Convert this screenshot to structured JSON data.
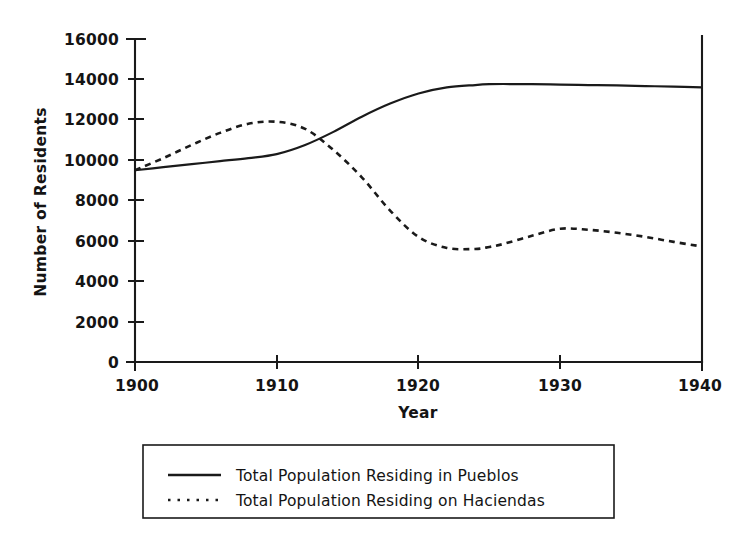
{
  "chart_data": {
    "type": "line",
    "title": "",
    "xlabel": "Year",
    "ylabel": "Number of Residents",
    "xlim": [
      1900,
      1940
    ],
    "ylim": [
      0,
      16000
    ],
    "grid": false,
    "legend_position": "bottom",
    "xticks": [
      1900,
      1910,
      1920,
      1930,
      1940
    ],
    "xtick_labels": [
      "1900",
      "1910",
      "1920",
      "1930",
      "1940"
    ],
    "yticks": [
      0,
      2000,
      4000,
      6000,
      8000,
      10000,
      12000,
      14000,
      16000
    ],
    "ytick_labels": [
      "0",
      "2000",
      "4000",
      "6000",
      "8000",
      "10000",
      "12000",
      "14000",
      "16000"
    ],
    "x": [
      1900,
      1902,
      1904,
      1906,
      1908,
      1910,
      1912,
      1914,
      1916,
      1918,
      1920,
      1922,
      1924,
      1925,
      1926,
      1928,
      1930,
      1932,
      1934,
      1936,
      1938,
      1940
    ],
    "series": [
      {
        "name": "Total Population Residing in Pueblos",
        "style": "solid",
        "color": "#1a1a1a",
        "values": [
          9500,
          9650,
          9800,
          9950,
          10100,
          10300,
          10750,
          11400,
          12150,
          12800,
          13300,
          13600,
          13720,
          13760,
          13770,
          13760,
          13740,
          13720,
          13700,
          13670,
          13640,
          13600
        ]
      },
      {
        "name": "Total Population Residing on Haciendas",
        "style": "dotted",
        "color": "#1a1a1a",
        "values": [
          9500,
          10100,
          10750,
          11350,
          11800,
          11900,
          11550,
          10500,
          9150,
          7500,
          6200,
          5650,
          5600,
          5700,
          5850,
          6250,
          6600,
          6550,
          6400,
          6200,
          5950,
          5720
        ]
      }
    ],
    "annotations": {
      "peak_haciendas_year": 1909,
      "peak_haciendas_value": 11900,
      "crossover_year": 1912,
      "crossover_value": 10800,
      "min_haciendas_year": 1923,
      "min_haciendas_value": 5600,
      "plateau_pueblos_value": 13760
    }
  },
  "legend": {
    "entries": [
      {
        "label": "Total Population Residing in Pueblos",
        "style": "solid"
      },
      {
        "label": "Total Population Residing on Haciendas",
        "style": "dotted"
      }
    ]
  }
}
